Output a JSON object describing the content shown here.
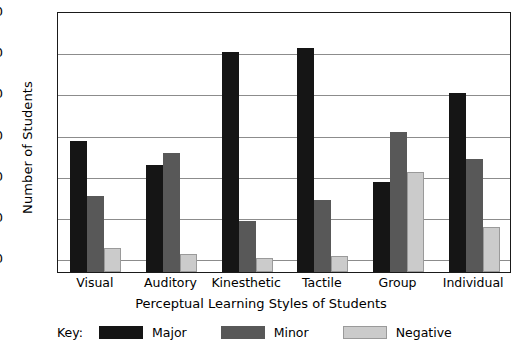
{
  "chart_data": {
    "type": "bar",
    "title": "",
    "xlabel": "Perceptual Learning Styles of Students",
    "ylabel": "Number of Students",
    "categories": [
      "Visual",
      "Auditory",
      "Kinesthetic",
      "Tactile",
      "Group",
      "Individual"
    ],
    "series": [
      {
        "name": "Major",
        "color": "#151515",
        "values": [
          57,
          45,
          100,
          102,
          37,
          80
        ]
      },
      {
        "name": "Minor",
        "color": "#585858",
        "values": [
          30,
          51,
          18,
          28,
          61,
          48
        ]
      },
      {
        "name": "Negative",
        "color": "#cbcbcb",
        "values": [
          5,
          2,
          0,
          1,
          42,
          15
        ]
      }
    ],
    "ylim": [
      0,
      120
    ],
    "yticks": [
      0,
      20,
      40,
      60,
      80,
      100,
      120
    ],
    "ytick_labels": [
      "0",
      "20",
      "40",
      "60",
      "80",
      "100",
      "120"
    ],
    "grid": true,
    "legend_position": "bottom-left",
    "legend_prefix": "Key:"
  }
}
